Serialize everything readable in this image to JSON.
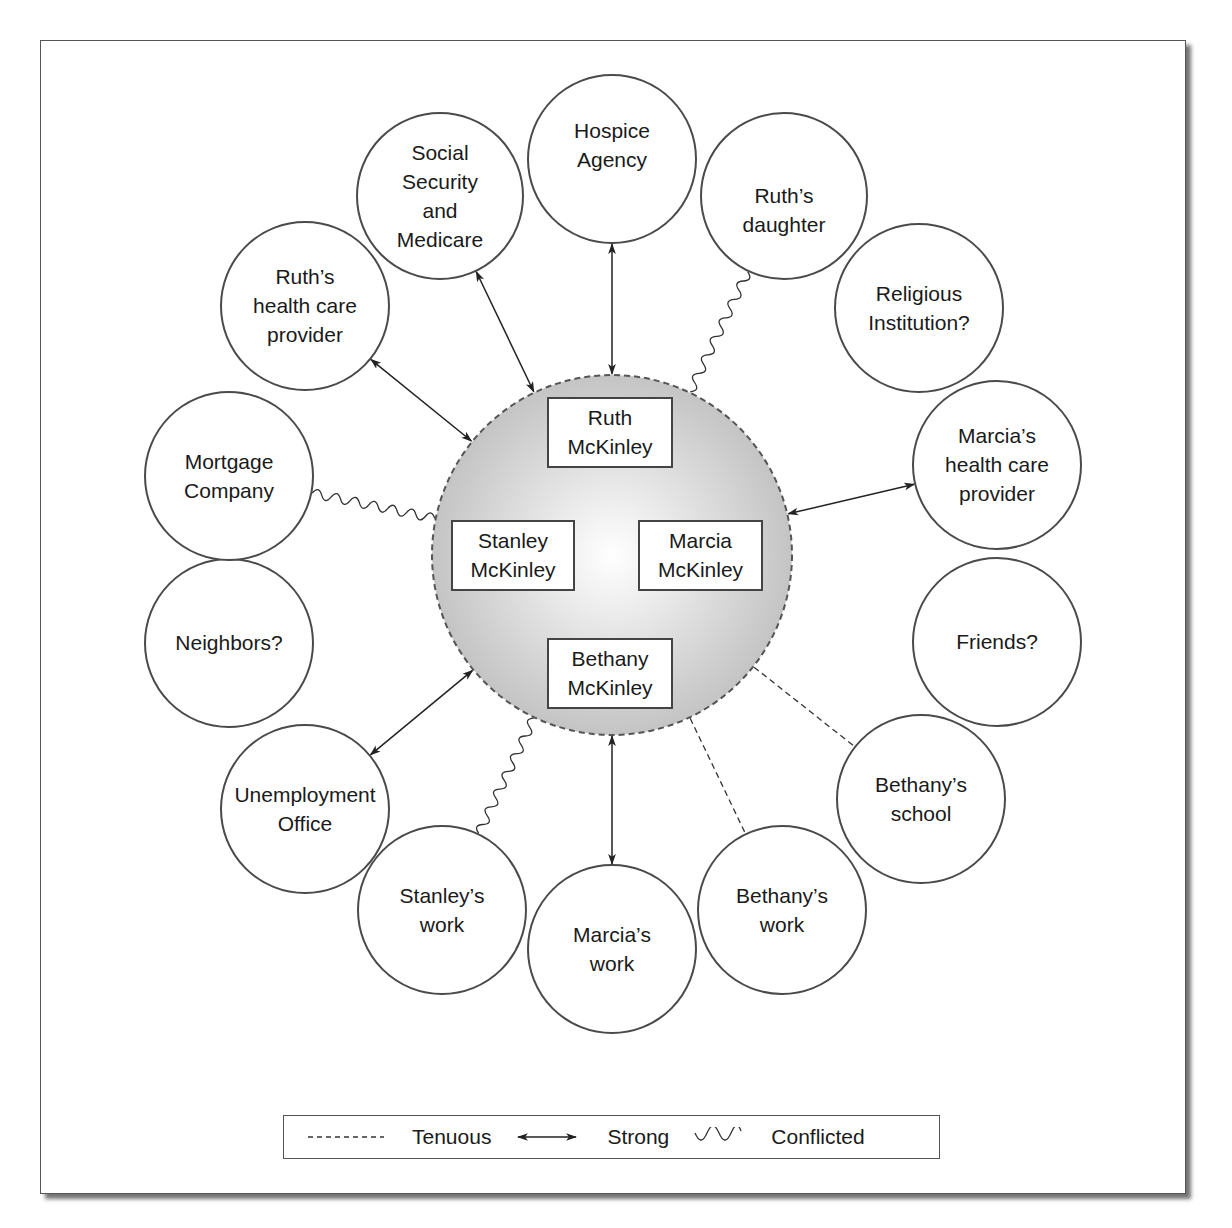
{
  "diagram": {
    "type": "ecomap",
    "family_circle": {
      "cx": 612,
      "cy": 555,
      "r": 180,
      "fill_center": "#ffffff",
      "fill_edge": "#c4c4c4",
      "stroke": "#555555",
      "border_style": "dashed",
      "members": [
        {
          "id": "ruth",
          "lines": [
            "Ruth",
            "McKinley"
          ],
          "x": 548,
          "y": 398,
          "w": 124,
          "h": 69
        },
        {
          "id": "stanley",
          "lines": [
            "Stanley",
            "McKinley"
          ],
          "x": 452,
          "y": 521,
          "w": 122,
          "h": 69
        },
        {
          "id": "marcia",
          "lines": [
            "Marcia",
            "McKinley"
          ],
          "x": 639,
          "y": 521,
          "w": 123,
          "h": 69
        },
        {
          "id": "bethany",
          "lines": [
            "Bethany",
            "McKinley"
          ],
          "x": 548,
          "y": 639,
          "w": 124,
          "h": 69
        }
      ]
    },
    "nodes": [
      {
        "id": "social-security",
        "lines": [
          "Social",
          "Security",
          "and",
          "Medicare"
        ],
        "cx": 440,
        "cy": 196,
        "r": 83
      },
      {
        "id": "hospice",
        "lines": [
          "Hospice",
          "Agency"
        ],
        "cx": 612,
        "cy": 159,
        "r": 84
      },
      {
        "id": "ruths-daughter",
        "lines": [
          "Ruth’s",
          "daughter"
        ],
        "cx": 784,
        "cy": 196,
        "r": 83
      },
      {
        "id": "religious-institution",
        "lines": [
          "Religious",
          "Institution?"
        ],
        "cx": 919,
        "cy": 308,
        "r": 84
      },
      {
        "id": "marcias-health-care",
        "lines": [
          "Marcia’s",
          "health care",
          "provider"
        ],
        "cx": 997,
        "cy": 465,
        "r": 84
      },
      {
        "id": "friends",
        "lines": [
          "Friends?"
        ],
        "cx": 997,
        "cy": 642,
        "r": 84
      },
      {
        "id": "bethanys-school",
        "lines": [
          "Bethany’s",
          "school"
        ],
        "cx": 921,
        "cy": 799,
        "r": 84
      },
      {
        "id": "bethanys-work",
        "lines": [
          "Bethany’s",
          "work"
        ],
        "cx": 782,
        "cy": 910,
        "r": 84
      },
      {
        "id": "marcias-work",
        "lines": [
          "Marcia’s",
          "work"
        ],
        "cx": 612,
        "cy": 949,
        "r": 84
      },
      {
        "id": "stanleys-work",
        "lines": [
          "Stanley’s",
          "work"
        ],
        "cx": 442,
        "cy": 910,
        "r": 84
      },
      {
        "id": "unemployment-office",
        "lines": [
          "Unemployment",
          "Office"
        ],
        "cx": 305,
        "cy": 809,
        "r": 84
      },
      {
        "id": "neighbors",
        "lines": [
          "Neighbors?"
        ],
        "cx": 229,
        "cy": 643,
        "r": 84
      },
      {
        "id": "mortgage-company",
        "lines": [
          "Mortgage",
          "Company"
        ],
        "cx": 229,
        "cy": 476,
        "r": 84
      },
      {
        "id": "ruths-health-care",
        "lines": [
          "Ruth’s",
          "health care",
          "provider"
        ],
        "cx": 305,
        "cy": 306,
        "r": 84
      }
    ],
    "connections": [
      {
        "node": "social-security",
        "type": "strong"
      },
      {
        "node": "hospice",
        "type": "strong"
      },
      {
        "node": "ruths-daughter",
        "type": "conflicted"
      },
      {
        "node": "marcias-health-care",
        "type": "strong"
      },
      {
        "node": "bethanys-school",
        "type": "tenuous"
      },
      {
        "node": "bethanys-work",
        "type": "tenuous"
      },
      {
        "node": "marcias-work",
        "type": "strong"
      },
      {
        "node": "stanleys-work",
        "type": "conflicted"
      },
      {
        "node": "unemployment-office",
        "type": "strong"
      },
      {
        "node": "mortgage-company",
        "type": "conflicted"
      },
      {
        "node": "ruths-health-care",
        "type": "strong"
      }
    ],
    "unconnected_nodes": [
      "religious-institution",
      "friends",
      "neighbors"
    ]
  },
  "legend": {
    "items": [
      {
        "type": "tenuous",
        "label": "Tenuous"
      },
      {
        "type": "strong",
        "label": "Strong"
      },
      {
        "type": "conflicted",
        "label": "Conflicted"
      }
    ]
  },
  "colors": {
    "stroke": "#4a4a4a",
    "text": "#1a1a1a",
    "line": "#222222"
  }
}
